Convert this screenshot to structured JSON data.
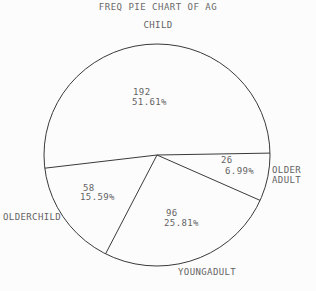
{
  "chart_data": {
    "type": "pie",
    "title": "FREQ PIE CHART OF AG",
    "total": 372,
    "start_angle_deg": -1,
    "direction": "clockwise",
    "legend_position": "none",
    "slices": [
      {
        "name": "OLDER ADULT",
        "value": 26,
        "pct": 6.99,
        "pct_label": "6.99%"
      },
      {
        "name": "YOUNGADULT",
        "value": 96,
        "pct": 25.81,
        "pct_label": "25.81%"
      },
      {
        "name": "OLDERCHILD",
        "value": 58,
        "pct": 15.59,
        "pct_label": "15.59%"
      },
      {
        "name": "CHILD",
        "value": 192,
        "pct": 51.61,
        "pct_label": "51.61%"
      }
    ],
    "style": {
      "line_color": "#3a3a3a",
      "text_color": "#636363",
      "background": "#fcfcfc",
      "fill": "none"
    },
    "geometry": {
      "cx": 157,
      "cy": 155,
      "rx": 113,
      "ry": 111
    }
  }
}
